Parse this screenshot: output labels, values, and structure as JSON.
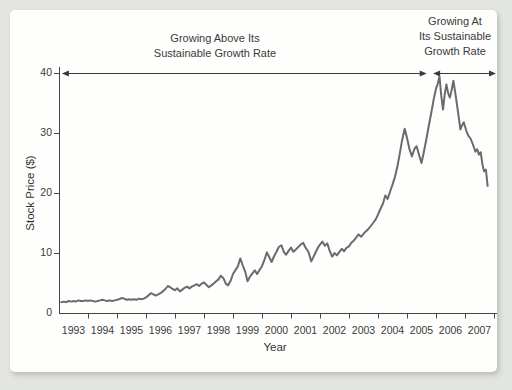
{
  "page": {
    "background_color": "#e3e5e1",
    "card_color": "#fefefd"
  },
  "chart_data": {
    "type": "line",
    "title": "",
    "xlabel": "Year",
    "ylabel": "Stock Price ($)",
    "x_ticks": [
      "1993",
      "1994",
      "1995",
      "1996",
      "1997",
      "1998",
      "1999",
      "2000",
      "2001",
      "2002",
      "2003",
      "2004",
      "2005",
      "2006",
      "2007"
    ],
    "y_ticks": [
      0,
      10,
      20,
      30,
      40
    ],
    "xlim": [
      1993,
      2008.1
    ],
    "ylim": [
      0,
      40
    ],
    "grid": false,
    "legend": "none",
    "line_color": "#6b6b6b",
    "axis_color": "#454545",
    "annotations": [
      {
        "line1": "Growing Above Its",
        "line2": "Sustainable Growth Rate",
        "line3": "",
        "span_years": [
          1993.1,
          2005.68
        ]
      },
      {
        "line1": "Growing At",
        "line2": "Its Sustainable",
        "line3": "Growth Rate",
        "span_years": [
          2005.9,
          2008.07
        ]
      }
    ],
    "series": [
      {
        "name": "Stock Price",
        "points": [
          [
            1993.08,
            1.8
          ],
          [
            1993.17,
            1.9
          ],
          [
            1993.25,
            1.8
          ],
          [
            1993.33,
            2.0
          ],
          [
            1993.42,
            1.9
          ],
          [
            1993.5,
            2.0
          ],
          [
            1993.58,
            1.9
          ],
          [
            1993.67,
            2.1
          ],
          [
            1993.75,
            2.0
          ],
          [
            1993.83,
            2.0
          ],
          [
            1993.92,
            2.1
          ],
          [
            1994.0,
            2.0
          ],
          [
            1994.08,
            2.1
          ],
          [
            1994.17,
            2.0
          ],
          [
            1994.25,
            1.9
          ],
          [
            1994.33,
            2.0
          ],
          [
            1994.42,
            2.1
          ],
          [
            1994.5,
            2.2
          ],
          [
            1994.58,
            2.1
          ],
          [
            1994.67,
            2.0
          ],
          [
            1994.75,
            2.1
          ],
          [
            1994.83,
            2.0
          ],
          [
            1994.92,
            2.1
          ],
          [
            1995.0,
            2.2
          ],
          [
            1995.08,
            2.3
          ],
          [
            1995.17,
            2.5
          ],
          [
            1995.25,
            2.4
          ],
          [
            1995.33,
            2.2
          ],
          [
            1995.42,
            2.3
          ],
          [
            1995.5,
            2.2
          ],
          [
            1995.58,
            2.3
          ],
          [
            1995.67,
            2.2
          ],
          [
            1995.75,
            2.4
          ],
          [
            1995.83,
            2.3
          ],
          [
            1995.92,
            2.4
          ],
          [
            1996.0,
            2.6
          ],
          [
            1996.08,
            2.9
          ],
          [
            1996.17,
            3.3
          ],
          [
            1996.25,
            3.1
          ],
          [
            1996.33,
            2.9
          ],
          [
            1996.42,
            3.1
          ],
          [
            1996.5,
            3.3
          ],
          [
            1996.58,
            3.6
          ],
          [
            1996.67,
            4.0
          ],
          [
            1996.75,
            4.5
          ],
          [
            1996.83,
            4.3
          ],
          [
            1996.92,
            4.0
          ],
          [
            1997.0,
            3.8
          ],
          [
            1997.08,
            4.1
          ],
          [
            1997.17,
            3.6
          ],
          [
            1997.25,
            3.9
          ],
          [
            1997.33,
            4.2
          ],
          [
            1997.42,
            4.4
          ],
          [
            1997.5,
            4.1
          ],
          [
            1997.58,
            4.4
          ],
          [
            1997.67,
            4.6
          ],
          [
            1997.75,
            4.8
          ],
          [
            1997.83,
            4.5
          ],
          [
            1997.92,
            4.9
          ],
          [
            1998.0,
            5.1
          ],
          [
            1998.08,
            4.7
          ],
          [
            1998.17,
            4.3
          ],
          [
            1998.25,
            4.6
          ],
          [
            1998.33,
            4.9
          ],
          [
            1998.42,
            5.3
          ],
          [
            1998.5,
            5.6
          ],
          [
            1998.58,
            6.2
          ],
          [
            1998.67,
            5.8
          ],
          [
            1998.75,
            4.9
          ],
          [
            1998.83,
            4.6
          ],
          [
            1998.92,
            5.4
          ],
          [
            1999.0,
            6.5
          ],
          [
            1999.08,
            7.1
          ],
          [
            1999.17,
            7.8
          ],
          [
            1999.25,
            9.1
          ],
          [
            1999.33,
            8.0
          ],
          [
            1999.42,
            6.9
          ],
          [
            1999.5,
            5.3
          ],
          [
            1999.58,
            6.0
          ],
          [
            1999.67,
            6.6
          ],
          [
            1999.75,
            7.1
          ],
          [
            1999.83,
            6.5
          ],
          [
            1999.92,
            7.2
          ],
          [
            2000.0,
            7.8
          ],
          [
            2000.08,
            8.8
          ],
          [
            2000.17,
            10.1
          ],
          [
            2000.25,
            9.3
          ],
          [
            2000.33,
            8.5
          ],
          [
            2000.42,
            9.5
          ],
          [
            2000.5,
            10.2
          ],
          [
            2000.58,
            11.0
          ],
          [
            2000.67,
            11.3
          ],
          [
            2000.75,
            10.2
          ],
          [
            2000.83,
            9.7
          ],
          [
            2000.92,
            10.4
          ],
          [
            2001.0,
            10.9
          ],
          [
            2001.08,
            10.2
          ],
          [
            2001.17,
            10.6
          ],
          [
            2001.25,
            11.0
          ],
          [
            2001.33,
            11.4
          ],
          [
            2001.42,
            11.7
          ],
          [
            2001.5,
            10.9
          ],
          [
            2001.6,
            10.2
          ],
          [
            2001.7,
            8.6
          ],
          [
            2001.78,
            9.4
          ],
          [
            2001.86,
            10.2
          ],
          [
            2001.94,
            11.0
          ],
          [
            2002.0,
            11.4
          ],
          [
            2002.08,
            11.9
          ],
          [
            2002.17,
            11.2
          ],
          [
            2002.25,
            11.6
          ],
          [
            2002.33,
            10.4
          ],
          [
            2002.42,
            9.4
          ],
          [
            2002.5,
            10.0
          ],
          [
            2002.58,
            9.6
          ],
          [
            2002.67,
            10.2
          ],
          [
            2002.75,
            10.7
          ],
          [
            2002.83,
            10.3
          ],
          [
            2002.92,
            10.9
          ],
          [
            2003.0,
            11.1
          ],
          [
            2003.08,
            11.7
          ],
          [
            2003.17,
            12.1
          ],
          [
            2003.25,
            12.6
          ],
          [
            2003.33,
            13.1
          ],
          [
            2003.42,
            12.7
          ],
          [
            2003.5,
            13.2
          ],
          [
            2003.58,
            13.6
          ],
          [
            2003.67,
            14.0
          ],
          [
            2003.75,
            14.5
          ],
          [
            2003.83,
            15.0
          ],
          [
            2003.92,
            15.6
          ],
          [
            2004.0,
            16.4
          ],
          [
            2004.08,
            17.3
          ],
          [
            2004.17,
            18.2
          ],
          [
            2004.25,
            19.6
          ],
          [
            2004.33,
            19.0
          ],
          [
            2004.42,
            20.3
          ],
          [
            2004.5,
            21.4
          ],
          [
            2004.58,
            22.6
          ],
          [
            2004.67,
            24.4
          ],
          [
            2004.75,
            26.6
          ],
          [
            2004.83,
            28.8
          ],
          [
            2004.92,
            30.7
          ],
          [
            2005.0,
            29.2
          ],
          [
            2005.08,
            27.4
          ],
          [
            2005.17,
            26.1
          ],
          [
            2005.25,
            27.3
          ],
          [
            2005.33,
            27.8
          ],
          [
            2005.42,
            26.3
          ],
          [
            2005.5,
            25.0
          ],
          [
            2005.58,
            26.8
          ],
          [
            2005.67,
            29.0
          ],
          [
            2005.75,
            31.2
          ],
          [
            2005.83,
            33.2
          ],
          [
            2005.92,
            35.6
          ],
          [
            2006.0,
            37.4
          ],
          [
            2006.06,
            38.2
          ],
          [
            2006.12,
            39.4
          ],
          [
            2006.18,
            36.3
          ],
          [
            2006.24,
            33.9
          ],
          [
            2006.3,
            36.4
          ],
          [
            2006.36,
            38.1
          ],
          [
            2006.42,
            36.6
          ],
          [
            2006.48,
            35.9
          ],
          [
            2006.54,
            37.2
          ],
          [
            2006.6,
            38.7
          ],
          [
            2006.66,
            36.9
          ],
          [
            2006.72,
            34.8
          ],
          [
            2006.78,
            32.8
          ],
          [
            2006.84,
            30.6
          ],
          [
            2006.9,
            31.3
          ],
          [
            2006.96,
            31.8
          ],
          [
            2007.04,
            30.4
          ],
          [
            2007.12,
            29.5
          ],
          [
            2007.2,
            29.0
          ],
          [
            2007.28,
            28.0
          ],
          [
            2007.36,
            26.9
          ],
          [
            2007.42,
            27.3
          ],
          [
            2007.48,
            26.4
          ],
          [
            2007.54,
            26.8
          ],
          [
            2007.6,
            24.8
          ],
          [
            2007.66,
            23.6
          ],
          [
            2007.72,
            23.9
          ],
          [
            2007.78,
            21.2
          ]
        ]
      }
    ]
  }
}
